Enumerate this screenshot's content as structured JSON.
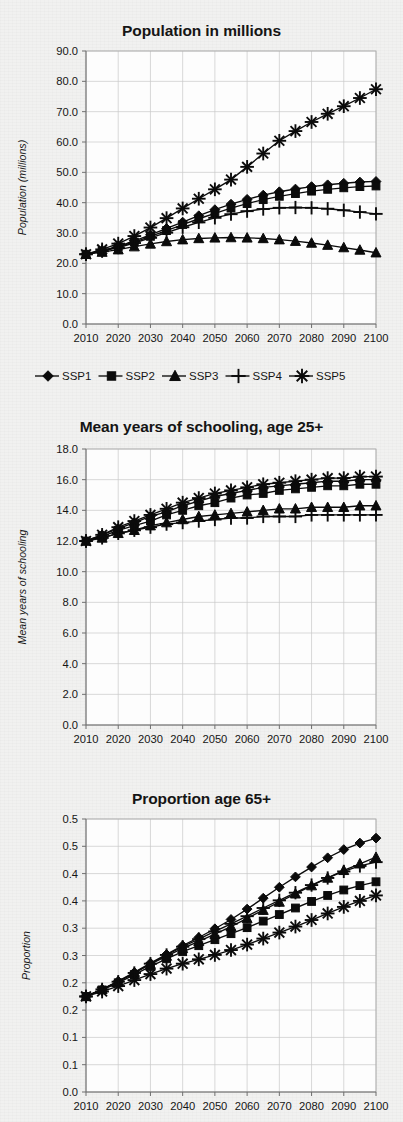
{
  "figure": {
    "background_color": "#f1f1f0",
    "ink_color": "#0b0b0b",
    "grid_color": "#c9c9c9"
  },
  "legend": {
    "position": "below-chart-1",
    "entries": [
      {
        "label": "SSP1",
        "marker": "diamond"
      },
      {
        "label": "SSP2",
        "marker": "square"
      },
      {
        "label": "SSP3",
        "marker": "triangle"
      },
      {
        "label": "SSP4",
        "marker": "plus"
      },
      {
        "label": "SSP5",
        "marker": "asterisk"
      }
    ]
  },
  "charts": [
    {
      "id": "population",
      "title": "Population in millions",
      "ylabel": "Population (millions)",
      "xlabel": ""
    },
    {
      "id": "schooling",
      "title": "Mean years of schooling, age 25+",
      "ylabel": "Mean years of schooling",
      "xlabel": ""
    },
    {
      "id": "proportion65",
      "title": "Proportion age 65+",
      "ylabel": "Proportion",
      "xlabel": ""
    }
  ],
  "chart_data": [
    {
      "type": "line",
      "title": "Population in millions",
      "xlabel": "",
      "ylabel": "Population (millions)",
      "x": [
        2010,
        2015,
        2020,
        2025,
        2030,
        2035,
        2040,
        2045,
        2050,
        2055,
        2060,
        2065,
        2070,
        2075,
        2080,
        2085,
        2090,
        2095,
        2100
      ],
      "xtick_labels": [
        "2010",
        "2020",
        "2030",
        "2040",
        "2050",
        "2060",
        "2070",
        "2080",
        "2090",
        "2100"
      ],
      "xticks": [
        2010,
        2020,
        2030,
        2040,
        2050,
        2060,
        2070,
        2080,
        2090,
        2100
      ],
      "xlim": [
        2010,
        2100
      ],
      "ylim": [
        0.0,
        90.0
      ],
      "yticks": [
        0.0,
        10.0,
        20.0,
        30.0,
        40.0,
        50.0,
        60.0,
        70.0,
        80.0,
        90.0
      ],
      "ytick_labels": [
        "0.0",
        "10.0",
        "20.0",
        "30.0",
        "40.0",
        "50.0",
        "60.0",
        "70.0",
        "80.0",
        "90.0"
      ],
      "grid": true,
      "legend": "below",
      "series": [
        {
          "name": "SSP1",
          "marker": "diamond",
          "values": [
            23.0,
            24.2,
            25.6,
            27.4,
            29.4,
            31.5,
            33.6,
            35.7,
            37.7,
            39.5,
            41.1,
            42.5,
            43.6,
            44.5,
            45.3,
            45.9,
            46.4,
            46.8,
            47.0
          ]
        },
        {
          "name": "SSP2",
          "marker": "square",
          "values": [
            23.0,
            24.1,
            25.4,
            27.0,
            28.9,
            30.8,
            32.8,
            34.7,
            36.5,
            38.2,
            39.7,
            41.0,
            42.1,
            43.0,
            43.8,
            44.4,
            44.9,
            45.3,
            45.5
          ]
        },
        {
          "name": "SSP3",
          "marker": "triangle",
          "values": [
            23.0,
            23.7,
            24.5,
            25.5,
            26.4,
            27.2,
            27.8,
            28.2,
            28.4,
            28.5,
            28.4,
            28.2,
            27.8,
            27.3,
            26.7,
            26.0,
            25.2,
            24.4,
            23.5
          ]
        },
        {
          "name": "SSP4",
          "marker": "plus",
          "values": [
            23.0,
            24.0,
            25.2,
            26.7,
            28.4,
            30.1,
            31.9,
            33.5,
            35.0,
            36.2,
            37.2,
            37.9,
            38.3,
            38.4,
            38.3,
            38.0,
            37.5,
            36.9,
            36.3
          ]
        },
        {
          "name": "SSP5",
          "marker": "asterisk",
          "values": [
            23.0,
            24.6,
            26.5,
            29.0,
            31.8,
            34.9,
            38.1,
            41.3,
            44.4,
            47.6,
            51.8,
            56.2,
            60.4,
            63.6,
            66.6,
            69.3,
            71.8,
            74.5,
            77.4
          ]
        }
      ]
    },
    {
      "type": "line",
      "title": "Mean years of schooling, age 25+",
      "xlabel": "",
      "ylabel": "Mean years of schooling",
      "x": [
        2010,
        2015,
        2020,
        2025,
        2030,
        2035,
        2040,
        2045,
        2050,
        2055,
        2060,
        2065,
        2070,
        2075,
        2080,
        2085,
        2090,
        2095,
        2100
      ],
      "xtick_labels": [
        "2010",
        "2020",
        "2030",
        "2040",
        "2050",
        "2060",
        "2070",
        "2080",
        "2090",
        "2100"
      ],
      "xticks": [
        2010,
        2020,
        2030,
        2040,
        2050,
        2060,
        2070,
        2080,
        2090,
        2100
      ],
      "xlim": [
        2010,
        2100
      ],
      "ylim": [
        0.0,
        18.0
      ],
      "yticks": [
        0.0,
        2.0,
        4.0,
        6.0,
        8.0,
        10.0,
        12.0,
        14.0,
        16.0,
        18.0
      ],
      "ytick_labels": [
        "0.0",
        "2.0",
        "4.0",
        "6.0",
        "8.0",
        "10.0",
        "12.0",
        "14.0",
        "16.0",
        "18.0"
      ],
      "grid": true,
      "legend": "none",
      "series": [
        {
          "name": "SSP1",
          "marker": "diamond",
          "values": [
            12.0,
            12.4,
            12.8,
            13.2,
            13.6,
            13.9,
            14.3,
            14.6,
            14.9,
            15.1,
            15.3,
            15.5,
            15.6,
            15.7,
            15.8,
            15.9,
            15.9,
            16.0,
            16.0
          ]
        },
        {
          "name": "SSP2",
          "marker": "square",
          "values": [
            12.0,
            12.3,
            12.7,
            13.0,
            13.3,
            13.7,
            14.0,
            14.3,
            14.5,
            14.8,
            15.0,
            15.1,
            15.3,
            15.4,
            15.5,
            15.6,
            15.6,
            15.7,
            15.7
          ]
        },
        {
          "name": "SSP3",
          "marker": "triangle",
          "values": [
            12.0,
            12.2,
            12.5,
            12.7,
            13.0,
            13.2,
            13.4,
            13.6,
            13.7,
            13.8,
            13.9,
            14.0,
            14.1,
            14.1,
            14.2,
            14.2,
            14.2,
            14.3,
            14.3
          ]
        },
        {
          "name": "SSP4",
          "marker": "plus",
          "values": [
            12.0,
            12.2,
            12.5,
            12.7,
            12.9,
            13.1,
            13.2,
            13.3,
            13.4,
            13.5,
            13.5,
            13.6,
            13.6,
            13.6,
            13.7,
            13.7,
            13.7,
            13.7,
            13.7
          ]
        },
        {
          "name": "SSP5",
          "marker": "asterisk",
          "values": [
            12.0,
            12.4,
            12.9,
            13.3,
            13.7,
            14.1,
            14.5,
            14.8,
            15.1,
            15.3,
            15.5,
            15.7,
            15.8,
            15.9,
            16.0,
            16.1,
            16.1,
            16.2,
            16.2
          ]
        }
      ]
    },
    {
      "type": "line",
      "title": "Proportion age 65+",
      "xlabel": "",
      "ylabel": "Proportion",
      "x": [
        2010,
        2015,
        2020,
        2025,
        2030,
        2035,
        2040,
        2045,
        2050,
        2055,
        2060,
        2065,
        2070,
        2075,
        2080,
        2085,
        2090,
        2095,
        2100
      ],
      "xtick_labels": [
        "2010",
        "2020",
        "2030",
        "2040",
        "2050",
        "2060",
        "2070",
        "2080",
        "2090",
        "2100"
      ],
      "xticks": [
        2010,
        2020,
        2030,
        2040,
        2050,
        2060,
        2070,
        2080,
        2090,
        2100
      ],
      "xlim": [
        2010,
        2100
      ],
      "ylim": [
        0.0,
        0.5
      ],
      "yticks": [
        0.0,
        0.05,
        0.1,
        0.15,
        0.2,
        0.25,
        0.3,
        0.35,
        0.4,
        0.45,
        0.5
      ],
      "ytick_labels": [
        "0.0",
        "0.1",
        "0.1",
        "0.2",
        "0.2",
        "0.3",
        "0.3",
        "0.4",
        "0.4",
        "0.5",
        "0.5"
      ],
      "grid": true,
      "legend": "none",
      "series": [
        {
          "name": "SSP1",
          "marker": "diamond",
          "values": [
            0.175,
            0.188,
            0.203,
            0.219,
            0.236,
            0.252,
            0.268,
            0.283,
            0.299,
            0.316,
            0.335,
            0.355,
            0.375,
            0.394,
            0.412,
            0.429,
            0.444,
            0.456,
            0.465
          ]
        },
        {
          "name": "SSP2",
          "marker": "square",
          "values": [
            0.175,
            0.187,
            0.2,
            0.215,
            0.23,
            0.244,
            0.257,
            0.268,
            0.279,
            0.29,
            0.301,
            0.313,
            0.325,
            0.337,
            0.349,
            0.36,
            0.37,
            0.378,
            0.385
          ]
        },
        {
          "name": "SSP3",
          "marker": "triangle",
          "values": [
            0.175,
            0.188,
            0.202,
            0.218,
            0.234,
            0.249,
            0.263,
            0.276,
            0.289,
            0.303,
            0.318,
            0.333,
            0.348,
            0.363,
            0.378,
            0.392,
            0.406,
            0.418,
            0.43
          ]
        },
        {
          "name": "SSP4",
          "marker": "plus",
          "values": [
            0.175,
            0.188,
            0.202,
            0.218,
            0.235,
            0.251,
            0.266,
            0.28,
            0.294,
            0.308,
            0.322,
            0.337,
            0.351,
            0.365,
            0.379,
            0.392,
            0.404,
            0.414,
            0.421
          ]
        },
        {
          "name": "SSP5",
          "marker": "asterisk",
          "values": [
            0.175,
            0.184,
            0.194,
            0.205,
            0.216,
            0.226,
            0.235,
            0.243,
            0.251,
            0.26,
            0.27,
            0.281,
            0.292,
            0.303,
            0.315,
            0.327,
            0.339,
            0.35,
            0.36
          ]
        }
      ]
    }
  ]
}
